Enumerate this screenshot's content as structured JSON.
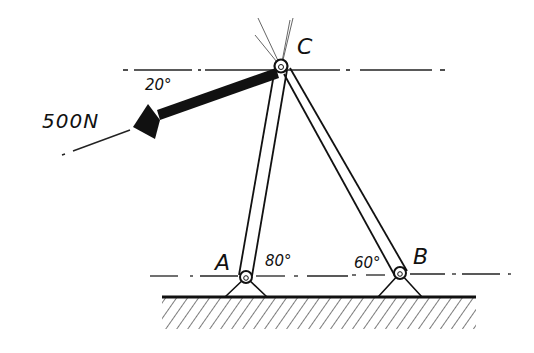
{
  "diagram": {
    "type": "two-member frame (statics)",
    "points": {
      "A": {
        "label": "A",
        "support": "pin"
      },
      "B": {
        "label": "B",
        "support": "pin"
      },
      "C": {
        "label": "C",
        "support": "pin joint"
      }
    },
    "members": [
      {
        "name": "AC",
        "angle_label": "80°"
      },
      {
        "name": "BC",
        "angle_label": "60°"
      }
    ],
    "load": {
      "magnitude_label": "500N",
      "angle_label": "20°",
      "applied_at": "C",
      "direction": "down-left, 20° below horizontal"
    },
    "colors": {
      "ink": "#111111",
      "background": "#ffffff"
    }
  }
}
